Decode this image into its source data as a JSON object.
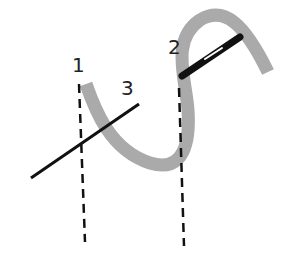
{
  "labels": {
    "one": "1",
    "two": "2",
    "three": "3"
  },
  "colors": {
    "thread": "#aaaaaa",
    "needle": "#111111",
    "dashed": "#111111",
    "background": "#ffffff"
  }
}
